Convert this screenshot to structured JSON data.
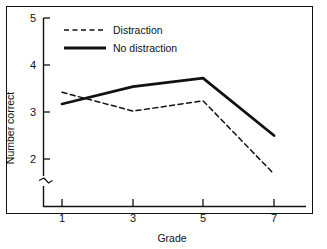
{
  "chart_data": {
    "type": "line",
    "title": "",
    "xlabel": "Grade",
    "ylabel": "Number correct",
    "x": [
      1,
      3,
      5,
      7
    ],
    "xtick_labels": [
      "1",
      "3",
      "5",
      "7"
    ],
    "ytick_labels": [
      "2",
      "3",
      "4",
      "5"
    ],
    "ytick_values": [
      2,
      3,
      4,
      5
    ],
    "ylim": [
      1.5,
      5
    ],
    "xlim": [
      0.45,
      7.8
    ],
    "y_axis_break": true,
    "grid": false,
    "legend_position": "top-left",
    "series": [
      {
        "name": "Distraction",
        "style": "dashed",
        "color": "#111111",
        "values": [
          3.42,
          3.02,
          3.24,
          1.68
        ]
      },
      {
        "name": "No distraction",
        "style": "solid",
        "color": "#111111",
        "values": [
          3.17,
          3.54,
          3.72,
          2.5
        ]
      }
    ]
  },
  "legend": {
    "items": [
      {
        "label": "Distraction",
        "style": "dashed"
      },
      {
        "label": "No distraction",
        "style": "solid"
      }
    ]
  },
  "axes": {
    "y_label": "Number correct",
    "x_label": "Grade",
    "y_ticks": [
      "5",
      "4",
      "3",
      "2"
    ],
    "x_ticks": [
      "1",
      "3",
      "5",
      "7"
    ]
  },
  "colors": {
    "line": "#111111",
    "axis": "#111111",
    "frame": "#111111",
    "background": "#ffffff"
  }
}
